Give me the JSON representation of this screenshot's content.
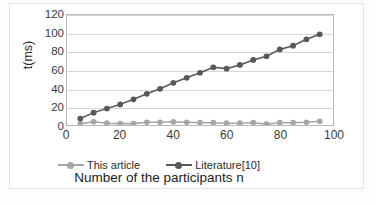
{
  "chart_data": {
    "type": "line",
    "title": "",
    "xlabel": "Number of the participants n",
    "ylabel": "t(ms)",
    "xlim": [
      0,
      100
    ],
    "ylim": [
      0,
      120
    ],
    "xticks": [
      0,
      20,
      40,
      60,
      80,
      100
    ],
    "yticks": [
      0,
      20,
      40,
      60,
      80,
      100,
      120
    ],
    "grid": "horizontal",
    "legend_position": "bottom",
    "x": [
      5,
      10,
      15,
      20,
      25,
      30,
      35,
      40,
      45,
      50,
      55,
      60,
      65,
      70,
      75,
      80,
      85,
      90,
      95
    ],
    "series": [
      {
        "name": "This article",
        "color": "#a6a6a6",
        "marker": "circle",
        "values": [
          1.5,
          3.5,
          2.0,
          1.5,
          1.5,
          3.0,
          3.0,
          3.5,
          3.0,
          2.5,
          2.5,
          2.0,
          2.0,
          2.5,
          1.0,
          2.5,
          2.5,
          3.0,
          4.0
        ]
      },
      {
        "name": "Literature[10]",
        "color": "#585858",
        "marker": "circle",
        "values": [
          7.0,
          13.5,
          18.0,
          22.5,
          28.0,
          34.0,
          39.5,
          46.0,
          51.5,
          57.0,
          63.0,
          61.5,
          65.5,
          71.0,
          75.0,
          82.5,
          86.5,
          93.5,
          99.0
        ]
      }
    ]
  },
  "axes": {
    "y_title": "t(ms)",
    "x_title": "Number of the participants n",
    "y_tick_labels": [
      "120",
      "100",
      "80",
      "60",
      "40",
      "20",
      "0"
    ],
    "x_tick_labels": [
      "0",
      "20",
      "40",
      "60",
      "80",
      "100"
    ]
  },
  "legend": {
    "items": [
      {
        "label": "This article",
        "color": "#a6a6a6"
      },
      {
        "label": "Literature[10]",
        "color": "#585858"
      }
    ]
  }
}
